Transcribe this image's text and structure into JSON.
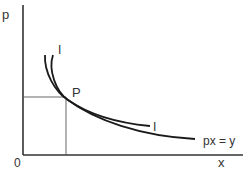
{
  "diagram": {
    "type": "economics-indifference-curve",
    "axes": {
      "y_label": "p",
      "x_label": "x",
      "origin_label": "0"
    },
    "labels": {
      "indifference_top": "I",
      "indifference_right": "I",
      "point": "P",
      "budget_curve": "px = y"
    },
    "colors": {
      "axis": "#333333",
      "curve": "#1a1a1a",
      "guide": "#555555",
      "text": "#333333"
    }
  }
}
